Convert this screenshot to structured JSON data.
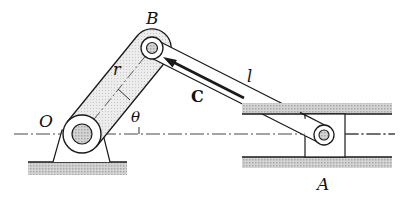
{
  "figure": {
    "type": "slider-crank mechanism",
    "labels": {
      "O": "O",
      "B": "B",
      "A": "A",
      "r": "r",
      "l": "l",
      "theta": "θ",
      "C": "C"
    },
    "colors": {
      "line": "#1a1a1a",
      "hatch_fill": "#bdbdbd",
      "crank_fill": "#e6e6e6",
      "background": "#ffffff"
    },
    "points": {
      "O": [
        82,
        134
      ],
      "B": [
        152,
        48
      ],
      "A": [
        324,
        135
      ]
    }
  }
}
